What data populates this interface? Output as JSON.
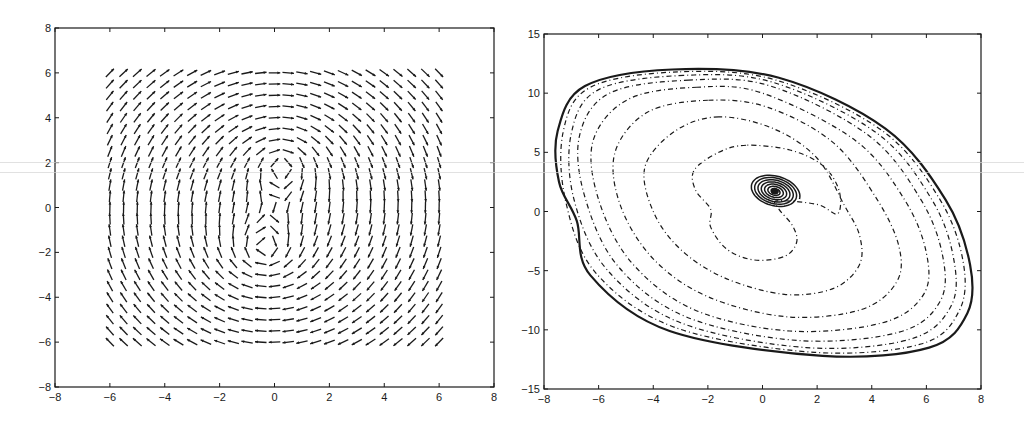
{
  "chart_data": [
    {
      "type": "quiver",
      "title": "",
      "xlabel": "",
      "ylabel": "",
      "xlim": [
        -8,
        8
      ],
      "ylim": [
        -8,
        8
      ],
      "xticks": [
        "-8",
        "-6",
        "-4",
        "-2",
        "0",
        "2",
        "4",
        "6",
        "8"
      ],
      "yticks": [
        "8",
        "6",
        "4",
        "2",
        "0",
        "-2",
        "-4",
        "-6",
        "-8"
      ],
      "grid": false,
      "legend": null,
      "field": {
        "description": "Velocity field: global clockwise rotation plus two clockwise point vortices",
        "grid_x": {
          "start": -6,
          "stop": 6,
          "step": 0.5
        },
        "grid_y": {
          "start": -6,
          "stop": 6,
          "step": 0.5
        },
        "background_rotation": {
          "u": "y",
          "v": "-x"
        },
        "vortices": [
          {
            "x": 0.3,
            "y": 2.0,
            "strength": -6.0,
            "direction": "clockwise"
          },
          {
            "x": -0.4,
            "y": -2.0,
            "strength": -6.0,
            "direction": "clockwise"
          }
        ],
        "arrow_length_units": 0.42
      },
      "frame": {
        "left": 55,
        "right": 494,
        "top": 28,
        "bottom": 387
      }
    },
    {
      "type": "line",
      "subtype": "contour / trajectory plot",
      "title": "",
      "xlabel": "",
      "ylabel": "",
      "xlim": [
        -8,
        8
      ],
      "ylim": [
        -15,
        15
      ],
      "xticks": [
        "-8",
        "-6",
        "-4",
        "-2",
        "0",
        "2",
        "4",
        "6",
        "8"
      ],
      "yticks": [
        "15",
        "10",
        "5",
        "0",
        "-5",
        "-10",
        "-15"
      ],
      "grid": false,
      "legend": null,
      "frame": {
        "left": 544,
        "right": 981,
        "top": 34,
        "bottom": 389
      },
      "center_spiral": {
        "center": [
          0.45,
          1.7
        ],
        "outer_rx": 0.95,
        "outer_ry": 1.35,
        "turns": 7,
        "tilt_deg": -18,
        "style": "solid"
      },
      "series": [
        {
          "name": "contour-1",
          "style": "dashdot",
          "points": [
            [
              -0.6,
              5.6
            ],
            [
              -1.6,
              5.0
            ],
            [
              -2.5,
              3.5
            ],
            [
              -2.45,
              1.8
            ],
            [
              -1.9,
              0.2
            ],
            [
              -1.9,
              -1.3
            ],
            [
              -1.3,
              -3.2
            ],
            [
              -0.3,
              -4.1
            ],
            [
              0.8,
              -3.8
            ],
            [
              1.25,
              -2.6
            ],
            [
              1.1,
              -1.2
            ],
            [
              0.6,
              0.2
            ],
            [
              0.55,
              0.9
            ],
            [
              2.0,
              0.6
            ],
            [
              2.75,
              -0.2
            ],
            [
              2.8,
              1.8
            ],
            [
              2.2,
              3.9
            ],
            [
              1.0,
              5.2
            ]
          ]
        },
        {
          "name": "contour-2",
          "style": "dashdot",
          "points": [
            [
              -1.6,
              8.0
            ],
            [
              -3.2,
              6.8
            ],
            [
              -4.3,
              3.8
            ],
            [
              -4.0,
              0.0
            ],
            [
              -3.0,
              -3.2
            ],
            [
              -1.4,
              -5.6
            ],
            [
              0.8,
              -7.0
            ],
            [
              2.6,
              -6.5
            ],
            [
              3.55,
              -4.5
            ],
            [
              3.55,
              -2.0
            ],
            [
              3.0,
              0.5
            ],
            [
              2.0,
              4.5
            ],
            [
              0.4,
              7.0
            ]
          ]
        },
        {
          "name": "contour-3",
          "style": "dashdot",
          "points": [
            [
              -2.0,
              9.4
            ],
            [
              -4.2,
              8.4
            ],
            [
              -5.4,
              5.0
            ],
            [
              -5.2,
              0.5
            ],
            [
              -4.0,
              -4.0
            ],
            [
              -2.0,
              -7.2
            ],
            [
              0.9,
              -8.9
            ],
            [
              3.6,
              -8.3
            ],
            [
              4.9,
              -6.0
            ],
            [
              5.0,
              -3.0
            ],
            [
              4.2,
              1.0
            ],
            [
              2.6,
              5.8
            ],
            [
              0.2,
              8.8
            ]
          ]
        },
        {
          "name": "contour-4",
          "style": "dashdot",
          "points": [
            [
              -2.4,
              10.5
            ],
            [
              -4.9,
              9.5
            ],
            [
              -6.2,
              6.0
            ],
            [
              -6.0,
              1.0
            ],
            [
              -4.8,
              -4.3
            ],
            [
              -2.5,
              -8.3
            ],
            [
              1.0,
              -10.1
            ],
            [
              4.4,
              -9.4
            ],
            [
              5.9,
              -7.0
            ],
            [
              6.0,
              -3.5
            ],
            [
              5.2,
              1.0
            ],
            [
              3.4,
              6.0
            ],
            [
              0.0,
              10.0
            ]
          ]
        },
        {
          "name": "contour-5",
          "style": "dashdot",
          "points": [
            [
              -2.7,
              11.1
            ],
            [
              -5.6,
              10.0
            ],
            [
              -6.7,
              6.4
            ],
            [
              -6.5,
              1.2
            ],
            [
              -5.3,
              -4.6
            ],
            [
              -2.8,
              -8.9
            ],
            [
              1.3,
              -10.9
            ],
            [
              5.0,
              -10.2
            ],
            [
              6.5,
              -7.6
            ],
            [
              6.6,
              -3.8
            ],
            [
              5.8,
              1.0
            ],
            [
              3.9,
              6.4
            ],
            [
              0.3,
              10.6
            ]
          ]
        },
        {
          "name": "contour-6",
          "style": "dashdot",
          "points": [
            [
              -2.9,
              11.5
            ],
            [
              -6.0,
              10.3
            ],
            [
              -7.0,
              6.6
            ],
            [
              -6.9,
              1.0
            ],
            [
              -5.7,
              -4.9
            ],
            [
              -3.0,
              -9.4
            ],
            [
              1.6,
              -11.5
            ],
            [
              5.4,
              -10.8
            ],
            [
              6.9,
              -8.0
            ],
            [
              7.0,
              -4.0
            ],
            [
              6.2,
              1.0
            ],
            [
              4.2,
              6.6
            ],
            [
              0.4,
              10.9
            ]
          ]
        },
        {
          "name": "contour-7",
          "style": "dashdot",
          "points": [
            [
              -3.1,
              11.8
            ],
            [
              -6.3,
              10.5
            ],
            [
              -7.3,
              6.7
            ],
            [
              -7.2,
              0.8
            ],
            [
              -6.1,
              -5.2
            ],
            [
              -3.2,
              -9.8
            ],
            [
              1.9,
              -11.9
            ],
            [
              5.8,
              -11.2
            ],
            [
              7.2,
              -8.4
            ],
            [
              7.35,
              -4.3
            ],
            [
              6.5,
              1.0
            ],
            [
              4.4,
              6.8
            ],
            [
              0.5,
              11.1
            ]
          ]
        },
        {
          "name": "contour-outer",
          "style": "solid",
          "points": [
            [
              -3.3,
              12.0
            ],
            [
              -6.5,
              10.6
            ],
            [
              -7.5,
              6.8
            ],
            [
              -7.45,
              2.5
            ],
            [
              -6.8,
              -0.8
            ],
            [
              -6.3,
              -5.4
            ],
            [
              -3.4,
              -10.1
            ],
            [
              2.2,
              -12.2
            ],
            [
              6.1,
              -11.5
            ],
            [
              7.5,
              -8.6
            ],
            [
              7.6,
              -4.5
            ],
            [
              6.7,
              1.0
            ],
            [
              4.5,
              7.0
            ],
            [
              0.6,
              11.3
            ]
          ]
        }
      ]
    }
  ],
  "figure": {
    "background": "#ffffff",
    "ink_color": "#1a1a1a",
    "scanlines_y": [
      162,
      172
    ]
  }
}
